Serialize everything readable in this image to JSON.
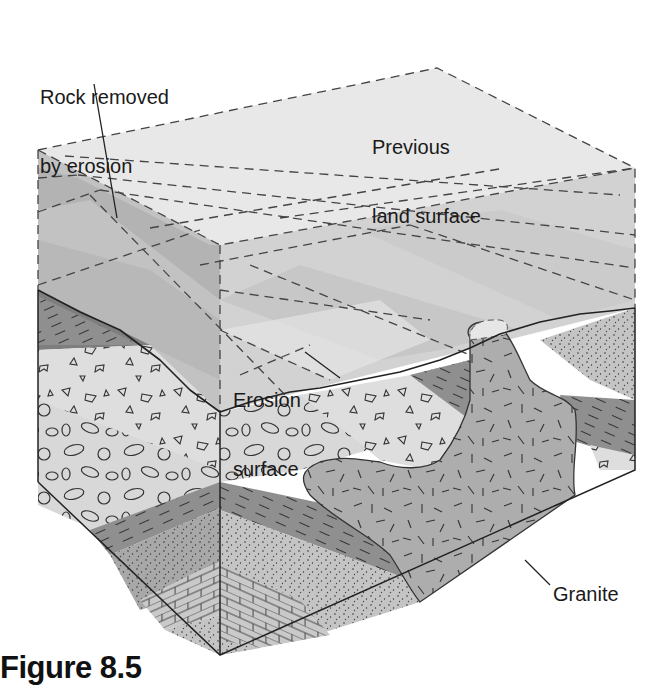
{
  "figure": {
    "caption": "Figure 8.5",
    "type": "block diagram"
  },
  "labels": {
    "rock_removed_line1": "Rock removed",
    "rock_removed_line2": "by erosion",
    "previous_line1": "Previous",
    "previous_line2": "land surface",
    "erosion_line1": "Erosion",
    "erosion_line2": "surface",
    "granite": "Granite"
  },
  "layers": [
    {
      "name": "limestone",
      "pattern": "brick"
    },
    {
      "name": "sandstone",
      "pattern": "stipple"
    },
    {
      "name": "shale",
      "pattern": "dashes"
    },
    {
      "name": "conglomerate",
      "pattern": "ovals"
    },
    {
      "name": "breccia",
      "pattern": "angular fragments"
    },
    {
      "name": "granite",
      "pattern": "random ticks"
    }
  ],
  "colors": {
    "removed_light": "#e6e6e6",
    "removed_mid": "#cfcfcf",
    "removed_dark": "#b5b5b5",
    "shale": "#8a8a8a",
    "sandstone": "#c4c4c4",
    "conglomerate": "#d8d8d8",
    "breccia": "#dedede",
    "granite": "#adadad",
    "limestone": "#c9c9c9",
    "outline": "#222222"
  }
}
